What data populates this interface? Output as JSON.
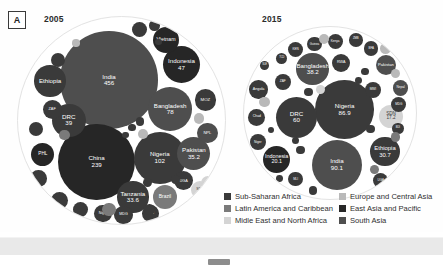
{
  "figure": {
    "panel_letter": "A",
    "panels": [
      {
        "id": "p2005",
        "year": "2005"
      },
      {
        "id": "p2015",
        "year": "2015"
      }
    ]
  },
  "legend": {
    "left": [
      {
        "label": "Sub-Saharan Africa",
        "color": "#3a3a3a"
      },
      {
        "label": "Latin America and Caribbean",
        "color": "#7a7a7a"
      },
      {
        "label": "Midle East and North Africa",
        "color": "#d4d4d4"
      }
    ],
    "right": [
      {
        "label": "Europe and Central Asia",
        "color": "#b9b9b9"
      },
      {
        "label": "East Asia and Pacific",
        "color": "#262626"
      },
      {
        "label": "South Asia",
        "color": "#4e4e4e"
      }
    ]
  },
  "chart_data": {
    "type": "bubble",
    "encoding": {
      "area": "value",
      "color": "region"
    },
    "region_colors": {
      "Sub-Saharan Africa": "#3a3a3a",
      "Latin America and Caribbean": "#7a7a7a",
      "Midle East and North Africa": "#d4d4d4",
      "Europe and Central Asia": "#b9b9b9",
      "East Asia and Pacific": "#262626",
      "South Asia": "#4e4e4e"
    },
    "panels": [
      {
        "year": "2005",
        "bubbles": [
          {
            "name": "India",
            "value": "456",
            "region": "South Asia",
            "cx": 44.0,
            "cy": 30.5,
            "r": 23.5
          },
          {
            "name": "China",
            "value": "239",
            "region": "East Asia and Pacific",
            "cx": 38.0,
            "cy": 70.0,
            "r": 18.5
          },
          {
            "name": "Nigeria",
            "value": "102",
            "region": "Sub-Saharan Africa",
            "cx": 68.5,
            "cy": 68.0,
            "r": 12.5
          },
          {
            "name": "Bangladesh",
            "value": "78",
            "region": "South Asia",
            "cx": 73.5,
            "cy": 44.5,
            "r": 10.5
          },
          {
            "name": "Indonesia",
            "value": "47",
            "region": "East Asia and Pacific",
            "cx": 79.0,
            "cy": 23.0,
            "r": 9.0
          },
          {
            "name": "Pakistan",
            "value": "35.2",
            "region": "South Asia",
            "cx": 85.0,
            "cy": 66.0,
            "r": 8.0
          },
          {
            "name": "Tanzania",
            "value": "33.6",
            "region": "Sub-Saharan Africa",
            "cx": 55.5,
            "cy": 87.0,
            "r": 7.6
          },
          {
            "name": "DRC",
            "value": "39",
            "region": "Sub-Saharan Africa",
            "cx": 24.5,
            "cy": 50.0,
            "r": 8.2
          },
          {
            "name": "Ethiopia",
            "value": "",
            "region": "Sub-Saharan Africa",
            "cx": 15.5,
            "cy": 31.0,
            "r": 7.6
          },
          {
            "name": "Vietnam",
            "value": "",
            "region": "East Asia and Pacific",
            "cx": 71.5,
            "cy": 11.0,
            "r": 6.3
          },
          {
            "name": "Brazil",
            "value": "",
            "region": "Latin America and Caribbean",
            "cx": 71.0,
            "cy": 87.0,
            "r": 6.0
          },
          {
            "name": "PHL",
            "value": "",
            "region": "East Asia and Pacific",
            "cx": 12.0,
            "cy": 66.5,
            "r": 5.6
          },
          {
            "name": "ZAF",
            "value": "",
            "region": "Sub-Saharan Africa",
            "cx": 16.5,
            "cy": 44.5,
            "r": 4.6
          },
          {
            "name": "MOZ",
            "value": "",
            "region": "Sub-Saharan Africa",
            "cx": 90.5,
            "cy": 40.0,
            "r": 5.2
          },
          {
            "name": "NPL",
            "value": "",
            "region": "South Asia",
            "cx": 91.5,
            "cy": 56.0,
            "r": 5.0
          },
          {
            "name": "UGA",
            "value": "",
            "region": "Sub-Saharan Africa",
            "cx": 80.0,
            "cy": 79.0,
            "r": 4.6
          },
          {
            "name": "Niger",
            "value": "",
            "region": "Sub-Saharan Africa",
            "cx": 41.0,
            "cy": 95.0,
            "r": 4.2
          },
          {
            "name": "MDG",
            "value": "",
            "region": "Sub-Saharan Africa",
            "cx": 51.0,
            "cy": 95.5,
            "r": 4.4
          },
          {
            "name": "MWI",
            "value": "",
            "region": "Sub-Saharan Africa",
            "cx": 64.0,
            "cy": 95.0,
            "r": 4.0
          },
          {
            "name": "SDN",
            "value": "",
            "region": "Midle East and North Africa",
            "cx": 88.0,
            "cy": 83.5,
            "r": 4.4
          },
          {
            "name": "",
            "value": "",
            "region": "Sub-Saharan Africa",
            "cx": 58.5,
            "cy": 6.0,
            "r": 3.6
          },
          {
            "name": "",
            "value": "",
            "region": "Sub-Saharan Africa",
            "cx": 66.0,
            "cy": 4.0,
            "r": 2.6
          },
          {
            "name": "",
            "value": "",
            "region": "Sub-Saharan Africa",
            "cx": 19.5,
            "cy": 21.0,
            "r": 3.4
          },
          {
            "name": "",
            "value": "",
            "region": "Sub-Saharan Africa",
            "cx": 8.5,
            "cy": 54.0,
            "r": 3.4
          },
          {
            "name": "",
            "value": "",
            "region": "Sub-Saharan Africa",
            "cx": 10.0,
            "cy": 78.0,
            "r": 4.0
          },
          {
            "name": "",
            "value": "",
            "region": "Sub-Saharan Africa",
            "cx": 20.0,
            "cy": 88.5,
            "r": 4.2
          },
          {
            "name": "",
            "value": "",
            "region": "Sub-Saharan Africa",
            "cx": 30.0,
            "cy": 93.0,
            "r": 3.6
          },
          {
            "name": "",
            "value": "",
            "region": "Sub-Saharan Africa",
            "cx": 63.5,
            "cy": 93.0,
            "r": 2.6
          },
          {
            "name": "",
            "value": "",
            "region": "Latin America and Caribbean",
            "cx": 22.5,
            "cy": 57.0,
            "r": 2.6
          },
          {
            "name": "",
            "value": "",
            "region": "Latin America and Caribbean",
            "cx": 44.0,
            "cy": 93.0,
            "r": 3.2
          },
          {
            "name": "",
            "value": "",
            "region": "Midle East and North Africa",
            "cx": 92.0,
            "cy": 80.0,
            "r": 3.4
          },
          {
            "name": "",
            "value": "",
            "region": "Europe and Central Asia",
            "cx": 60.5,
            "cy": 56.5,
            "r": 2.4
          },
          {
            "name": "",
            "value": "",
            "region": "Europe and Central Asia",
            "cx": 87.5,
            "cy": 49.0,
            "r": 2.6
          },
          {
            "name": "",
            "value": "",
            "region": "Europe and Central Asia",
            "cx": 28.0,
            "cy": 12.5,
            "r": 1.8
          },
          {
            "name": "",
            "value": "",
            "region": "Sub-Saharan Africa",
            "cx": 76.0,
            "cy": 78.5,
            "r": 2.2
          },
          {
            "name": "",
            "value": "",
            "region": "Sub-Saharan Africa",
            "cx": 62.5,
            "cy": 80.0,
            "r": 2.2
          },
          {
            "name": "",
            "value": "",
            "region": "Sub-Saharan Africa",
            "cx": 59.0,
            "cy": 50.5,
            "r": 2.0
          },
          {
            "name": "",
            "value": "",
            "region": "Sub-Saharan Africa",
            "cx": 55.0,
            "cy": 53.5,
            "r": 1.8
          },
          {
            "name": "",
            "value": "",
            "region": "Sub-Saharan Africa",
            "cx": 52.0,
            "cy": 57.0,
            "r": 1.6
          },
          {
            "name": "",
            "value": "",
            "region": "Sub-Saharan Africa",
            "cx": 68.0,
            "cy": 12.0,
            "r": 1.6
          }
        ]
      },
      {
        "year": "2015",
        "bubbles": [
          {
            "name": "Nigeria",
            "value": "86.9",
            "region": "Sub-Saharan Africa",
            "cx": 58.5,
            "cy": 48.0,
            "r": 17.0
          },
          {
            "name": "India",
            "value": "90.1",
            "region": "South Asia",
            "cx": 54.0,
            "cy": 80.0,
            "r": 14.5
          },
          {
            "name": "DRC",
            "value": "60",
            "region": "Sub-Saharan Africa",
            "cx": 30.5,
            "cy": 52.5,
            "r": 12.0
          },
          {
            "name": "Bangladesh",
            "value": "38.2",
            "region": "South Asia",
            "cx": 40.0,
            "cy": 24.5,
            "r": 9.5
          },
          {
            "name": "Ethiopia",
            "value": "30.7",
            "region": "Sub-Saharan Africa",
            "cx": 82.0,
            "cy": 72.5,
            "r": 8.6
          },
          {
            "name": "Indonesia",
            "value": "20.1",
            "region": "East Asia and Pacific",
            "cx": 19.0,
            "cy": 77.0,
            "r": 7.8
          },
          {
            "name": "SDN",
            "value": "17.2",
            "region": "Midle East and North Africa",
            "cx": 85.5,
            "cy": 52.0,
            "r": 6.8
          },
          {
            "name": "Pakistan",
            "value": "",
            "region": "South Asia",
            "cx": 82.5,
            "cy": 22.0,
            "r": 6.0
          },
          {
            "name": "Angola",
            "value": "",
            "region": "Sub-Saharan Africa",
            "cx": 8.5,
            "cy": 36.5,
            "r": 5.4
          },
          {
            "name": "Chad",
            "value": "",
            "region": "Sub-Saharan Africa",
            "cx": 7.5,
            "cy": 52.5,
            "r": 5.0
          },
          {
            "name": "Niger",
            "value": "",
            "region": "Sub-Saharan Africa",
            "cx": 8.0,
            "cy": 67.0,
            "r": 4.6
          },
          {
            "name": "Nepal",
            "value": "",
            "region": "South Asia",
            "cx": 91.0,
            "cy": 35.5,
            "r": 4.6
          },
          {
            "name": "MWI",
            "value": "",
            "region": "Sub-Saharan Africa",
            "cx": 75.0,
            "cy": 36.5,
            "r": 4.6
          },
          {
            "name": "MDG",
            "value": "",
            "region": "Sub-Saharan Africa",
            "cx": 90.0,
            "cy": 45.0,
            "r": 4.4
          },
          {
            "name": "UGA",
            "value": "",
            "region": "Sub-Saharan Africa",
            "cx": 79.5,
            "cy": 89.5,
            "r": 4.4
          },
          {
            "name": "MLI",
            "value": "",
            "region": "Sub-Saharan Africa",
            "cx": 30.0,
            "cy": 88.5,
            "r": 4.2
          },
          {
            "name": "ZAF",
            "value": "",
            "region": "Sub-Saharan Africa",
            "cx": 22.5,
            "cy": 32.0,
            "r": 4.6
          },
          {
            "name": "KEN",
            "value": "",
            "region": "Sub-Saharan Africa",
            "cx": 30.0,
            "cy": 13.0,
            "r": 4.4
          },
          {
            "name": "Guinea",
            "value": "",
            "region": "Sub-Saharan Africa",
            "cx": 41.0,
            "cy": 10.0,
            "r": 4.2
          },
          {
            "name": "Kenya",
            "value": "",
            "region": "Sub-Saharan Africa",
            "cx": 53.0,
            "cy": 8.5,
            "r": 4.4
          },
          {
            "name": "ZMB",
            "value": "",
            "region": "Sub-Saharan Africa",
            "cx": 65.0,
            "cy": 7.5,
            "r": 4.0
          },
          {
            "name": "BFA",
            "value": "",
            "region": "Sub-Saharan Africa",
            "cx": 74.0,
            "cy": 12.5,
            "r": 4.2
          },
          {
            "name": "RWA",
            "value": "",
            "region": "Sub-Saharan Africa",
            "cx": 56.5,
            "cy": 21.0,
            "r": 5.4
          },
          {
            "name": "TCD",
            "value": "",
            "region": "Sub-Saharan Africa",
            "cx": 22.0,
            "cy": 18.5,
            "r": 3.2
          },
          {
            "name": "BDI",
            "value": "",
            "region": "Sub-Saharan Africa",
            "cx": 89.5,
            "cy": 59.0,
            "r": 3.4
          },
          {
            "name": "SLE",
            "value": "",
            "region": "Sub-Saharan Africa",
            "cx": 12.0,
            "cy": 22.5,
            "r": 2.6
          },
          {
            "name": "",
            "value": "",
            "region": "Europe and Central Asia",
            "cx": 46.5,
            "cy": 7.0,
            "r": 3.0
          },
          {
            "name": "",
            "value": "",
            "region": "Europe and Central Asia",
            "cx": 82.5,
            "cy": 12.5,
            "r": 3.2
          },
          {
            "name": "",
            "value": "",
            "region": "Europe and Central Asia",
            "cx": 88.0,
            "cy": 27.0,
            "r": 2.8
          },
          {
            "name": "",
            "value": "",
            "region": "Europe and Central Asia",
            "cx": 12.0,
            "cy": 43.5,
            "r": 3.0
          },
          {
            "name": "",
            "value": "",
            "region": "Latin America and Caribbean",
            "cx": 88.0,
            "cy": 64.0,
            "r": 2.8
          },
          {
            "name": "",
            "value": "",
            "region": "Latin America and Caribbean",
            "cx": 76.0,
            "cy": 83.0,
            "r": 2.6
          },
          {
            "name": "",
            "value": "",
            "region": "Midle East and North Africa",
            "cx": 44.5,
            "cy": 36.5,
            "r": 2.6
          },
          {
            "name": "",
            "value": "",
            "region": "Sub-Saharan Africa",
            "cx": 37.5,
            "cy": 38.0,
            "r": 2.4
          },
          {
            "name": "",
            "value": "",
            "region": "Sub-Saharan Africa",
            "cx": 33.0,
            "cy": 71.5,
            "r": 2.6
          },
          {
            "name": "",
            "value": "",
            "region": "Sub-Saharan Africa",
            "cx": 30.0,
            "cy": 66.0,
            "r": 2.2
          },
          {
            "name": "",
            "value": "",
            "region": "Sub-Saharan Africa",
            "cx": 73.5,
            "cy": 59.5,
            "r": 2.4
          },
          {
            "name": "",
            "value": "",
            "region": "Sub-Saharan Africa",
            "cx": 70.5,
            "cy": 26.0,
            "r": 2.2
          },
          {
            "name": "",
            "value": "",
            "region": "Sub-Saharan Africa",
            "cx": 66.5,
            "cy": 31.0,
            "r": 2.0
          },
          {
            "name": "",
            "value": "",
            "region": "Sub-Saharan Africa",
            "cx": 15.5,
            "cy": 60.0,
            "r": 1.8
          },
          {
            "name": "",
            "value": "",
            "region": "Sub-Saharan Africa",
            "cx": 40.0,
            "cy": 95.0,
            "r": 2.4
          },
          {
            "name": "",
            "value": "",
            "region": "Sub-Saharan Africa",
            "cx": 20.5,
            "cy": 88.0,
            "r": 2.0
          }
        ]
      }
    ]
  }
}
